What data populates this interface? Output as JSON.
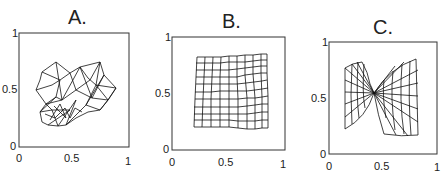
{
  "panels": [
    {
      "title": "A.",
      "description": "Random tangled mesh",
      "y_ticks": [
        "0",
        "0.5",
        "1"
      ],
      "x_ticks": [
        "0",
        "0.5",
        "1"
      ]
    },
    {
      "title": "B.",
      "description": "Nearly regular grid",
      "y_ticks": [
        "0",
        "0.5",
        "1"
      ],
      "x_ticks": [
        "0",
        "0.5",
        "1"
      ]
    },
    {
      "title": "C.",
      "description": "Twisted bow-tie grid",
      "y_ticks": [
        "0",
        "0.5",
        "1"
      ],
      "x_ticks": [
        "0",
        "0.5",
        "1"
      ]
    }
  ]
}
